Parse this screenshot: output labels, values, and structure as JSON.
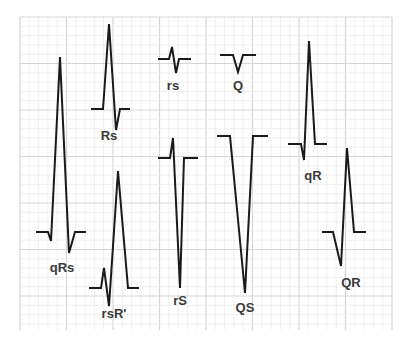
{
  "diagram": {
    "grid": {
      "x0": 20,
      "y0": 17,
      "x1": 392,
      "y1": 330,
      "minor_spacing": 9.3,
      "major_every": 5,
      "minor_color": "#ececec",
      "major_color": "#d6d6d6"
    },
    "stroke_color": "#1a1a1a",
    "label_color": "#3a3a3a",
    "complexes": [
      {
        "label": "qRs",
        "label_x": 62,
        "label_y": 272,
        "points": "36,232 48,232 51,241 60,57 69,253 75,232 86,232"
      },
      {
        "label": "Rs",
        "label_x": 109,
        "label_y": 140,
        "points": "91,109 103,109 109,24 116,130 120,109 130,109"
      },
      {
        "label": "rs",
        "label_x": 173,
        "label_y": 90,
        "points": "158,59 169,59 172,47 176,73 179,59 191,59"
      },
      {
        "label": "Q",
        "label_x": 238,
        "label_y": 90,
        "points": "220,55 233,55 238,72 243,55 256,55"
      },
      {
        "label": "rsR'",
        "label_x": 114,
        "label_y": 318,
        "points": "89,288 101,288 104,268 109,306 118,171 128,288 139,288"
      },
      {
        "label": "rS",
        "label_x": 180,
        "label_y": 305,
        "points": "158,158 170,158 173,138 180,288 184,158 198,158"
      },
      {
        "label": "QS",
        "label_x": 245,
        "label_y": 312,
        "points": "217,136 230,136 245,293 253,136 268,136"
      },
      {
        "label": "qR",
        "label_x": 313,
        "label_y": 180,
        "points": "288,144 301,144 304,160 309,41 315,144 327,144"
      },
      {
        "label": "QR",
        "label_x": 351,
        "label_y": 287,
        "points": "322,232 333,232 341,266 347,148 354,232 366,232"
      }
    ]
  }
}
